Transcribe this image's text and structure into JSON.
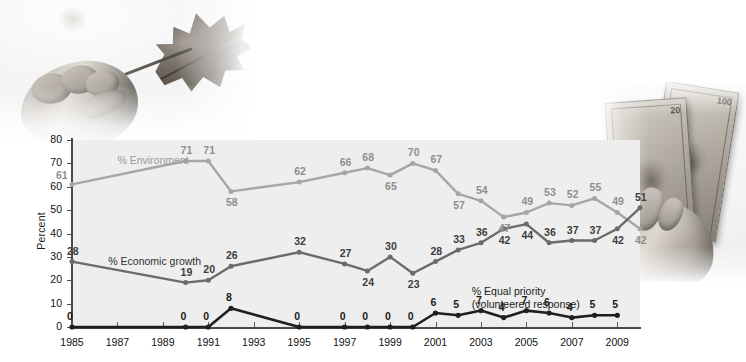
{
  "chart_data": {
    "type": "line",
    "title": "",
    "subtitle": "",
    "xlabel": "",
    "ylabel": "Percent",
    "ylim": [
      0,
      80
    ],
    "ytick_step": 10,
    "yticks": [
      0,
      10,
      20,
      30,
      40,
      50,
      60,
      70,
      80
    ],
    "xticks": [
      "1985",
      "1987",
      "1989",
      "1991",
      "1993",
      "1995",
      "1997",
      "1999",
      "2001",
      "2003",
      "2005",
      "2007",
      "2009"
    ],
    "xlim": [
      1985,
      2009
    ],
    "grid": false,
    "legend_position": "inline-annotations",
    "series": [
      {
        "name": "% Environment",
        "color": "#a6a6a6",
        "label_color": "#8f8f8f",
        "points": [
          {
            "x": 1985,
            "y": 61,
            "label": "61",
            "pos": "left"
          },
          {
            "x": 1990,
            "y": 71,
            "label": "71",
            "pos": "above"
          },
          {
            "x": 1991,
            "y": 71,
            "label": "71",
            "pos": "above"
          },
          {
            "x": 1992,
            "y": 58,
            "label": "58",
            "pos": "below"
          },
          {
            "x": 1995,
            "y": 62,
            "label": "62",
            "pos": "above"
          },
          {
            "x": 1997,
            "y": 66,
            "label": "66",
            "pos": "above"
          },
          {
            "x": 1998,
            "y": 68,
            "label": "68",
            "pos": "above"
          },
          {
            "x": 1999,
            "y": 65,
            "label": "65",
            "pos": "below"
          },
          {
            "x": 2000,
            "y": 70,
            "label": "70",
            "pos": "above"
          },
          {
            "x": 2001,
            "y": 67,
            "label": "67",
            "pos": "above"
          },
          {
            "x": 2002,
            "y": 57,
            "label": "57",
            "pos": "below"
          },
          {
            "x": 2003,
            "y": 54,
            "label": "54",
            "pos": "above"
          },
          {
            "x": 2004,
            "y": 47,
            "label": "47",
            "pos": "below"
          },
          {
            "x": 2005,
            "y": 49,
            "label": "49",
            "pos": "above"
          },
          {
            "x": 2006,
            "y": 53,
            "label": "53",
            "pos": "above"
          },
          {
            "x": 2007,
            "y": 52,
            "label": "52",
            "pos": "above"
          },
          {
            "x": 2008,
            "y": 55,
            "label": "55",
            "pos": "above"
          },
          {
            "x": 2009,
            "y": 49,
            "label": "49",
            "pos": "above"
          },
          {
            "x": 2010,
            "y": 42,
            "label": "42",
            "pos": "below"
          }
        ]
      },
      {
        "name": "% Economic growth",
        "color": "#6b6b6b",
        "label_color": "#3d3d3d",
        "points": [
          {
            "x": 1985,
            "y": 28,
            "label": "28",
            "pos": "above"
          },
          {
            "x": 1990,
            "y": 19,
            "label": "19",
            "pos": "above"
          },
          {
            "x": 1991,
            "y": 20,
            "label": "20",
            "pos": "above"
          },
          {
            "x": 1992,
            "y": 26,
            "label": "26",
            "pos": "above"
          },
          {
            "x": 1995,
            "y": 32,
            "label": "32",
            "pos": "above"
          },
          {
            "x": 1997,
            "y": 27,
            "label": "27",
            "pos": "above"
          },
          {
            "x": 1998,
            "y": 24,
            "label": "24",
            "pos": "below"
          },
          {
            "x": 1999,
            "y": 30,
            "label": "30",
            "pos": "above"
          },
          {
            "x": 2000,
            "y": 23,
            "label": "23",
            "pos": "below"
          },
          {
            "x": 2001,
            "y": 28,
            "label": "28",
            "pos": "above"
          },
          {
            "x": 2002,
            "y": 33,
            "label": "33",
            "pos": "above"
          },
          {
            "x": 2003,
            "y": 36,
            "label": "36",
            "pos": "above"
          },
          {
            "x": 2004,
            "y": 42,
            "label": "42",
            "pos": "below"
          },
          {
            "x": 2005,
            "y": 44,
            "label": "44",
            "pos": "below"
          },
          {
            "x": 2006,
            "y": 36,
            "label": "36",
            "pos": "above"
          },
          {
            "x": 2007,
            "y": 37,
            "label": "37",
            "pos": "above"
          },
          {
            "x": 2008,
            "y": 37,
            "label": "37",
            "pos": "above"
          },
          {
            "x": 2009,
            "y": 42,
            "label": "42",
            "pos": "below"
          },
          {
            "x": 2010,
            "y": 51,
            "label": "51",
            "pos": "above"
          }
        ]
      },
      {
        "name": "% Equal priority (volunteered response)",
        "color": "#1f1f1f",
        "label_color": "#1b1b1b",
        "points": [
          {
            "x": 1985,
            "y": 0,
            "label": "0",
            "pos": "above"
          },
          {
            "x": 1990,
            "y": 0,
            "label": "0",
            "pos": "above"
          },
          {
            "x": 1991,
            "y": 0,
            "label": "0",
            "pos": "above"
          },
          {
            "x": 1992,
            "y": 8,
            "label": "8",
            "pos": "above"
          },
          {
            "x": 1995,
            "y": 0,
            "label": "0",
            "pos": "above"
          },
          {
            "x": 1997,
            "y": 0,
            "label": "0",
            "pos": "above"
          },
          {
            "x": 1998,
            "y": 0,
            "label": "0",
            "pos": "above"
          },
          {
            "x": 1999,
            "y": 0,
            "label": "0",
            "pos": "above"
          },
          {
            "x": 2000,
            "y": 0,
            "label": "0",
            "pos": "above"
          },
          {
            "x": 2001,
            "y": 6,
            "label": "6",
            "pos": "above"
          },
          {
            "x": 2002,
            "y": 5,
            "label": "5",
            "pos": "above"
          },
          {
            "x": 2003,
            "y": 7,
            "label": "7",
            "pos": "above"
          },
          {
            "x": 2004,
            "y": 4,
            "label": "4",
            "pos": "above"
          },
          {
            "x": 2005,
            "y": 7,
            "label": "7",
            "pos": "above"
          },
          {
            "x": 2006,
            "y": 6,
            "label": "6",
            "pos": "above"
          },
          {
            "x": 2007,
            "y": 4,
            "label": "4",
            "pos": "above"
          },
          {
            "x": 2008,
            "y": 5,
            "label": "5",
            "pos": "above"
          },
          {
            "x": 2009,
            "y": 5,
            "label": "5",
            "pos": "above"
          }
        ]
      }
    ],
    "annotations": [
      {
        "name": "series-label-environment",
        "text": "% Environment",
        "x": 1987.0,
        "y": 74
      },
      {
        "name": "series-label-economic-growth",
        "text": "% Economic growth",
        "x": 1986.6,
        "y": 31
      },
      {
        "name": "series-label-equal-priority-line1",
        "text": "% Equal priority",
        "x": 2002.6,
        "y": 18
      },
      {
        "name": "series-label-equal-priority-line2",
        "text": "(volunteered response)",
        "x": 2002.6,
        "y": 13
      }
    ]
  },
  "photos": [
    {
      "name": "photo-hand-holding-leaf",
      "alt": "Hand holding a dry oak leaf"
    },
    {
      "name": "photo-hand-holding-money",
      "alt": "Hand holding US dollar bills"
    }
  ],
  "colors": {
    "plot_background": "#eeeeee",
    "page_background": "#ffffff",
    "axis": "#4a4a4a",
    "environment": "#a6a6a6",
    "economic_growth": "#6b6b6b",
    "equal_priority": "#1f1f1f"
  }
}
